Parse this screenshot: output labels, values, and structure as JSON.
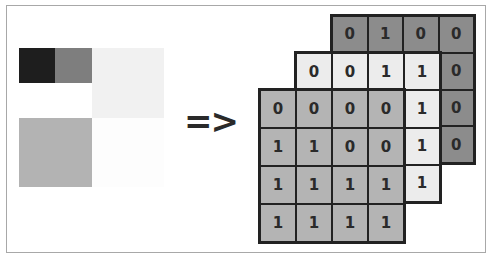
{
  "input_image": {
    "blocks": [
      {
        "name": "dark-pixel",
        "x": 19,
        "y": 48,
        "w": 36,
        "h": 35,
        "color": "#1e1e1e"
      },
      {
        "name": "gray-pixel",
        "x": 55,
        "y": 48,
        "w": 37,
        "h": 35,
        "color": "#7e7e7e"
      },
      {
        "name": "white-region-left",
        "x": 19,
        "y": 83,
        "w": 73,
        "h": 35,
        "color": "#ffffff"
      },
      {
        "name": "light-gray-region",
        "x": 92,
        "y": 48,
        "w": 72,
        "h": 70,
        "color": "#f1f1f1"
      },
      {
        "name": "mid-gray-region",
        "x": 19,
        "y": 118,
        "w": 73,
        "h": 69,
        "color": "#b3b3b3"
      },
      {
        "name": "white-region",
        "x": 92,
        "y": 118,
        "w": 72,
        "h": 69,
        "color": "#fdfdfd"
      }
    ]
  },
  "arrow": {
    "label": "=>"
  },
  "grids": {
    "back": {
      "color": "#8c8c8c",
      "values": [
        [
          "0",
          "1",
          "0",
          "0"
        ],
        [
          "",
          "",
          "",
          "0"
        ],
        [
          "",
          "",
          "",
          "0"
        ],
        [
          "",
          "",
          "",
          "0"
        ]
      ]
    },
    "middle": {
      "color": "#ececec",
      "values": [
        [
          "0",
          "0",
          "1",
          "1"
        ],
        [
          "",
          "",
          "",
          "1"
        ],
        [
          "",
          "",
          "",
          "1"
        ],
        [
          "",
          "",
          "",
          "1"
        ]
      ]
    },
    "front": {
      "color": "#b4b4b4",
      "values": [
        [
          "0",
          "0",
          "0",
          "0"
        ],
        [
          "1",
          "1",
          "0",
          "0"
        ],
        [
          "1",
          "1",
          "1",
          "1"
        ],
        [
          "1",
          "1",
          "1",
          "1"
        ]
      ]
    }
  }
}
